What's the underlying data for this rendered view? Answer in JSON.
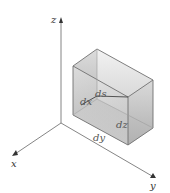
{
  "diagram": {
    "axes": {
      "x": "x",
      "y": "y",
      "z": "z"
    },
    "labels": {
      "dx": "dx",
      "dy": "dy",
      "dz": "dz",
      "ds": "ds"
    },
    "colors": {
      "axis": "#555555",
      "box_edge": "#6a6a6a",
      "face_light": "#e4e4e4",
      "face_mid": "#cfcfcf",
      "face_dark": "#b5b5b5",
      "diagonal": "#444444"
    }
  }
}
